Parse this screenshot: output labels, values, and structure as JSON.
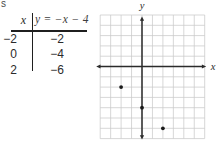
{
  "page": {
    "cutoff_fragment": "s"
  },
  "table": {
    "header": {
      "x_label": "x",
      "equation_label": "y = −x − 4"
    },
    "rows": [
      {
        "x": "−2",
        "y": "−2"
      },
      {
        "x": "0",
        "y": "−4"
      },
      {
        "x": "2",
        "y": "−6"
      }
    ]
  },
  "chart_data": {
    "type": "scatter",
    "equation": "y = −x − 4",
    "x": [
      -2,
      0,
      2
    ],
    "y": [
      -2,
      -4,
      -6
    ],
    "xlabel": "x",
    "ylabel": "y",
    "xlim": [
      -4,
      6
    ],
    "ylim": [
      -7,
      5
    ],
    "grid": true,
    "grid_unit": 1,
    "legend": false,
    "colors": {
      "grid_line": "#c9c9c9",
      "axis": "#2b2b2b",
      "point": "#1a1a1a",
      "label": "#2b2b2b"
    }
  }
}
